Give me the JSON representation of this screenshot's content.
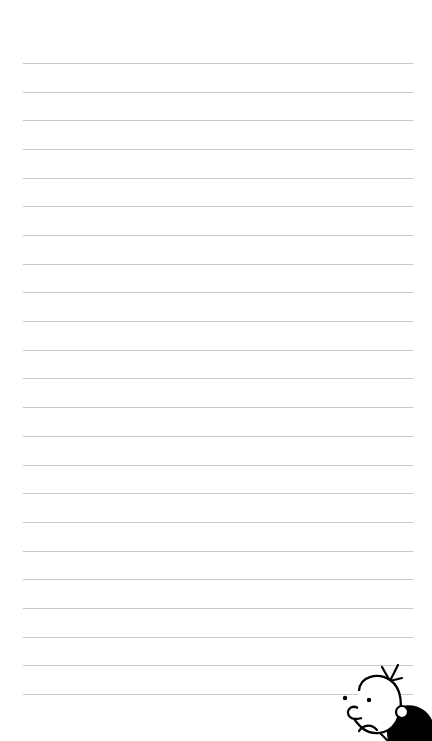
{
  "page": {
    "type": "lined-notebook-page",
    "background_color": "#ffffff",
    "line_color": "#c9c9c9",
    "line_count": 23,
    "first_line_y": 63,
    "line_spacing": 28.68,
    "line_left": 23,
    "line_right": 413
  },
  "illustration": {
    "name": "cartoon-boy-worried",
    "position": "bottom-right",
    "stroke_color": "#000000"
  }
}
